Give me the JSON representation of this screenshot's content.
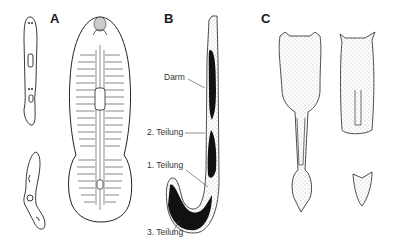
{
  "panels": [
    {
      "letter": "A",
      "subject": "planarian-fission"
    },
    {
      "letter": "B",
      "subject": "worm-division",
      "labels": [
        "Darm",
        "2. Teilung",
        "1. Teilung",
        "3. Teilung"
      ]
    },
    {
      "letter": "C",
      "subject": "budding-organisms"
    }
  ],
  "colors": {
    "ink": "#1a1a1a",
    "background": "#ffffff"
  }
}
